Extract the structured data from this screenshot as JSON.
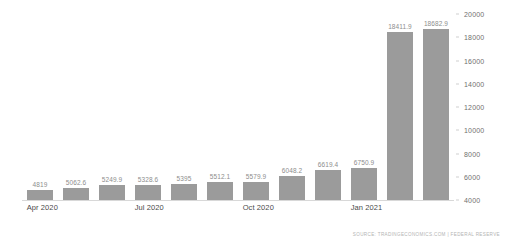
{
  "chart_data": {
    "type": "bar",
    "title": "",
    "subtitle": "",
    "xlabel": "",
    "ylabel": "",
    "ylim": [
      4000,
      20000
    ],
    "grid": false,
    "legend": null,
    "bar_color": "#9b9b9b",
    "background_color": "#ffffff",
    "categories": [
      "Apr 2020",
      "May 2020",
      "Jun 2020",
      "Jul 2020",
      "Aug 2020",
      "Sep 2020",
      "Oct 2020",
      "Nov 2020",
      "Dec 2020",
      "Jan 2021",
      "Feb 2021",
      "Mar 2021"
    ],
    "values": [
      4819,
      5062.6,
      5249.9,
      5328.6,
      5395,
      5512.1,
      5579.9,
      6048.2,
      6619.4,
      6750.9,
      18411.9,
      18682.9
    ],
    "point_labels": [
      "4819",
      "5062.6",
      "5249.9",
      "5328.6",
      "5395",
      "5512.1",
      "5579.9",
      "6048.2",
      "6619.4",
      "6750.9",
      "18411.9",
      "18682.9"
    ],
    "y_ticks": [
      4000,
      6000,
      8000,
      10000,
      12000,
      14000,
      16000,
      18000,
      20000
    ],
    "y_tick_labels": [
      "4000",
      "6000",
      "8000",
      "10000",
      "12000",
      "14000",
      "16000",
      "18000",
      "20000"
    ],
    "y_axis_position": "right",
    "x_tick_labels": [
      {
        "index": 0,
        "label": "Apr 2020"
      },
      {
        "index": 3,
        "label": "Jul 2020"
      },
      {
        "index": 6,
        "label": "Oct 2020"
      },
      {
        "index": 9,
        "label": "Jan 2021"
      }
    ]
  },
  "footer": {
    "source": "SOURCE: TRADINGECONOMICS.COM | FEDERAL RESERVE"
  }
}
